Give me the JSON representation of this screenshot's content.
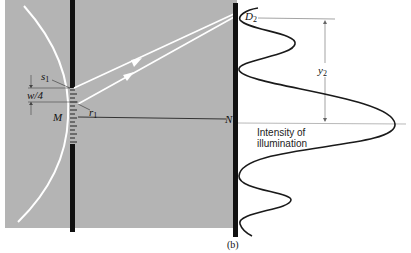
{
  "figure": {
    "caption": "(b)",
    "labels": {
      "s1": "s",
      "s1_sub": "1",
      "r1": "r",
      "r1_sub": "1",
      "w4": "w/4",
      "M": "M",
      "N": "N",
      "D2": "D",
      "D2_sub": "2",
      "y2": "y",
      "y2_sub": "2",
      "intensity_line1": "Intensity of",
      "intensity_line2": "illumination"
    },
    "colors": {
      "background_panel": "#b4b4b4",
      "barrier": "#111111",
      "rays": "#ffffff",
      "curve": "#1a1a1a"
    }
  }
}
